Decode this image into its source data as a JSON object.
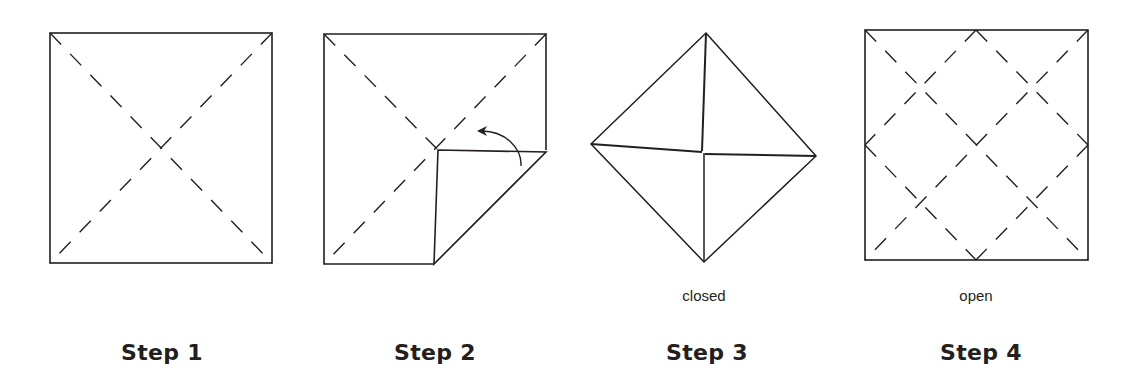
{
  "steps": [
    {
      "label": "Step 1",
      "caption": ""
    },
    {
      "label": "Step 2",
      "caption": ""
    },
    {
      "label": "Step 3",
      "caption": "closed"
    },
    {
      "label": "Step 4",
      "caption": "open"
    }
  ],
  "colors": {
    "line": "#231f20",
    "background": "#ffffff"
  }
}
